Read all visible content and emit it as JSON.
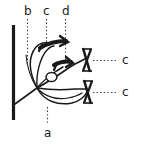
{
  "figure": {
    "type": "anatomical-line-diagram",
    "background_color": "#ffffff",
    "ink_color": "#1a1a1a",
    "labels": {
      "b": "b",
      "c_top": "c",
      "d": "d",
      "a": "a",
      "c_right_upper": "c",
      "c_right_lower": "c"
    },
    "leader_lines": [
      {
        "label": "b",
        "style": "dotted",
        "orientation": "vertical",
        "from": [
          27,
          20
        ],
        "to": [
          27,
          63
        ]
      },
      {
        "label": "c_top",
        "style": "dotted",
        "orientation": "vertical",
        "from": [
          46,
          20
        ],
        "to": [
          46,
          45
        ]
      },
      {
        "label": "d",
        "style": "dotted",
        "orientation": "vertical",
        "from": [
          65,
          20
        ],
        "to": [
          65,
          60
        ]
      },
      {
        "label": "a",
        "style": "dotted",
        "orientation": "vertical",
        "from": [
          47,
          108
        ],
        "to": [
          47,
          124
        ]
      },
      {
        "label": "c_right_upper",
        "style": "dotted",
        "orientation": "horizontal",
        "from": [
          93,
          60
        ],
        "to": [
          118,
          60
        ]
      },
      {
        "label": "c_right_lower",
        "style": "dotted",
        "orientation": "horizontal",
        "from": [
          93,
          92
        ],
        "to": [
          118,
          92
        ]
      }
    ],
    "parts": {
      "vertical_bar": "thick vertical stroke at left edge (bone / support surface)",
      "convergence_point": [
        37,
        88
      ],
      "small_oval": [
        51,
        76
      ],
      "markers": [
        "crossed-marker-upper",
        "crossed-marker-lower",
        "barb-upper",
        "barb-middle"
      ]
    }
  }
}
